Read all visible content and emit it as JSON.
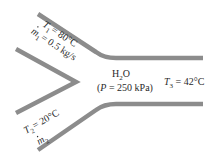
{
  "figure": {
    "type": "mixing-chamber",
    "pipe_color": "#8c8c8c",
    "background": "#ffffff",
    "text_color": "#2a2a2a"
  },
  "inlet1": {
    "temperature_symbol": "T",
    "temperature_sub": "1",
    "temperature_value": "= 80°C",
    "massflow_symbol": "m",
    "massflow_sub": "1",
    "massflow_value": "= 0.5 kg/s"
  },
  "inlet2": {
    "temperature_symbol": "T",
    "temperature_sub": "2",
    "temperature_value": "= 20°C",
    "massflow_symbol": "m",
    "massflow_sub": "2"
  },
  "chamber": {
    "fluid_main": "H",
    "fluid_sub": "2",
    "fluid_tail": "O",
    "pressure_open": "(",
    "pressure_symbol": "P",
    "pressure_value": " = 250 kPa)"
  },
  "outlet": {
    "temperature_symbol": "T",
    "temperature_sub": "3",
    "temperature_value": " = 42°C"
  }
}
